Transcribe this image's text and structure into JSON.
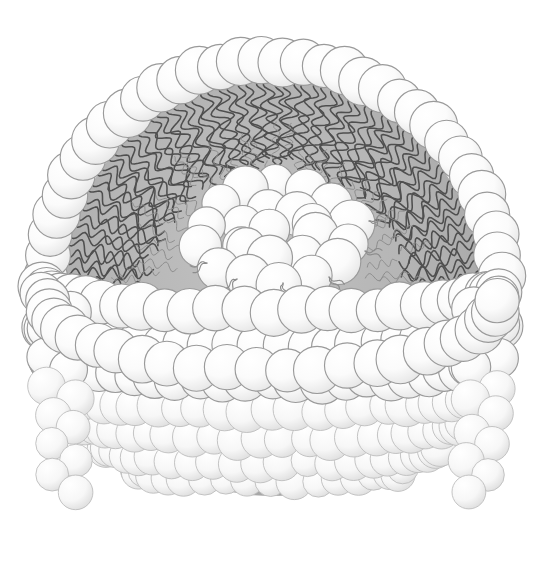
{
  "figure": {
    "name": "liposome-cross-section-diagram",
    "canvas": {
      "width": 550,
      "height": 575
    },
    "background_color": "#ffffff"
  },
  "colors": {
    "background": "#ffffff",
    "core_fill": "#b4b4b4",
    "core_fill_light": "#c0c0c0",
    "core_fill_dark": "#a8a8a8",
    "head_fill": "#fdfdfd",
    "head_fill_shade": "#e8e8e8",
    "head_stroke": "#9a9a9a",
    "head_stroke_light": "#bdbdbd",
    "tail_stroke": "#4f4f4f",
    "tail_stroke_faint": "#8c8c8c"
  },
  "geometry": {
    "center_x": 272,
    "center_y": 288,
    "outer_ring_radius_x": 228,
    "outer_ring_radius_y": 228,
    "core_radius_x": 208,
    "core_radius_y": 208,
    "inner_cluster_center_x": 277,
    "inner_cluster_center_y": 235,
    "inner_cluster_radius_x": 92,
    "inner_cluster_radius_y": 58,
    "head_radius": 23,
    "tail_length": 86,
    "tail_wave_amplitude": 7,
    "tail_wave_count": 4
  },
  "structure": {
    "outer_ring": {
      "name": "outer-head-ring",
      "count": 34,
      "description": "Upper arc of phospholipid head groups each bearing two inward-pointing wavy tails",
      "arc_start_deg": 183,
      "arc_end_deg": 357
    },
    "inner_core_cluster": {
      "name": "inner-head-cluster",
      "count": 24,
      "description": "Oval cluster of overlapping head-group spheres at the vesicle center"
    },
    "bowl_rows": {
      "name": "lower-bowl-rows",
      "description": "Stacked rows of head-group spheres forming the visible lower hemisphere in perspective",
      "rows": [
        {
          "index": 0,
          "count": 26,
          "y_offset": 0,
          "radius_scale": 1.0,
          "head_radius": 23
        },
        {
          "index": 1,
          "count": 28,
          "y_offset": 36,
          "radius_scale": 1.0,
          "head_radius": 22
        },
        {
          "index": 2,
          "count": 28,
          "y_offset": 70,
          "radius_scale": 0.97,
          "head_radius": 21
        },
        {
          "index": 3,
          "count": 27,
          "y_offset": 102,
          "radius_scale": 0.92,
          "head_radius": 20
        },
        {
          "index": 4,
          "count": 25,
          "y_offset": 132,
          "radius_scale": 0.84,
          "head_radius": 19
        },
        {
          "index": 5,
          "count": 22,
          "y_offset": 158,
          "radius_scale": 0.73,
          "head_radius": 18
        },
        {
          "index": 6,
          "count": 18,
          "y_offset": 180,
          "radius_scale": 0.59,
          "head_radius": 17
        }
      ]
    },
    "inner_leaflet_ring": {
      "name": "inner-leaflet-head-ring",
      "count": 22,
      "description": "Lower inner rim of head groups bordering the gray hydrophobic core"
    },
    "tails": {
      "name": "hydrophobic-tail-pairs",
      "per_head": 2,
      "style": "wavy",
      "direction": "inward toward vesicle center"
    }
  },
  "legend": {
    "head_label": "hydrophilic head group",
    "tail_label": "hydrophobic fatty-acid tail",
    "core_label": "hydrophobic core"
  }
}
